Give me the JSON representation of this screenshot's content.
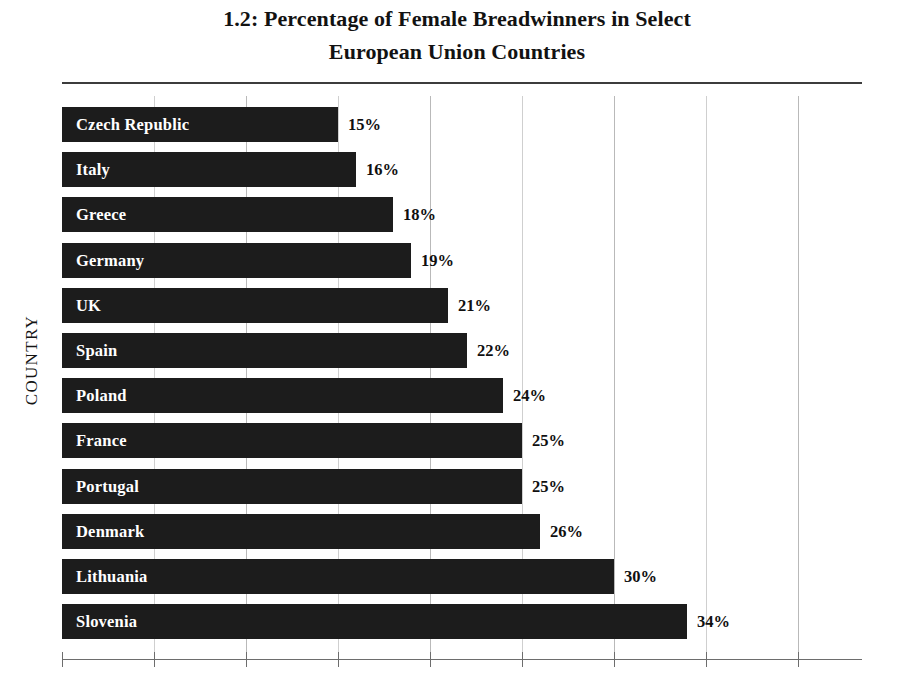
{
  "chart_data": {
    "type": "bar",
    "orientation": "horizontal",
    "title": "1.2: Percentage of Female Breadwinners in Select European Union Countries",
    "title_lines": [
      "1.2: Percentage of Female Breadwinners in Select",
      "European Union Countries"
    ],
    "xlabel": "",
    "ylabel": "COUNTRY",
    "categories": [
      "Czech Republic",
      "Italy",
      "Greece",
      "Germany",
      "UK",
      "Spain",
      "Poland",
      "France",
      "Portugal",
      "Denmark",
      "Lithuania",
      "Slovenia"
    ],
    "values": [
      15,
      16,
      18,
      19,
      21,
      22,
      24,
      25,
      25,
      26,
      30,
      34
    ],
    "value_labels": [
      "15%",
      "16%",
      "18%",
      "19%",
      "21%",
      "22%",
      "24%",
      "25%",
      "25%",
      "26%",
      "30%",
      "34%"
    ],
    "xlim": [
      0,
      43.5
    ],
    "x_tick_values": [
      0,
      5,
      10,
      15,
      20,
      25,
      30,
      35,
      40
    ],
    "x_tick_labels": [],
    "gridlines": "vertical",
    "legend": null,
    "bar_color": "#1c1c1c",
    "bar_label_color": "#ffffff",
    "value_label_color": "#101010",
    "background_color": "#ffffff"
  }
}
